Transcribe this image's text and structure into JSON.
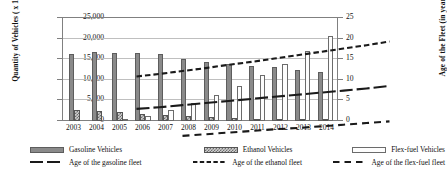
{
  "chart_data": {
    "type": "bar",
    "title": "",
    "subtitle": "",
    "xlabel": "",
    "ylabel": "Quantity of  Vehicles ( x 10^3 )",
    "y2label": "Age of the Fleet (in years)",
    "ylim": [
      0,
      25000
    ],
    "y2lim": [
      0,
      25
    ],
    "grid": true,
    "legend_position": "bottom",
    "categories": [
      "2003",
      "2004",
      "2005",
      "2006",
      "2007",
      "2008",
      "2009",
      "2010",
      "2011",
      "2012",
      "2013",
      "2014"
    ],
    "y_ticks": [
      "0",
      "5,000",
      "10,000",
      "15,000",
      "20,000",
      "25,000"
    ],
    "y2_ticks": [
      "0",
      "5",
      "10",
      "15",
      "20",
      "25"
    ],
    "series": [
      {
        "name": "Gasoline Vehicles",
        "type": "bar",
        "axis": "left",
        "color": "#8a8a8a",
        "values": [
          16000,
          16500,
          16300,
          16400,
          16100,
          15000,
          14200,
          13600,
          13300,
          12900,
          12300,
          11700
        ]
      },
      {
        "name": "Ethanol Vehicles",
        "type": "bar",
        "axis": "left",
        "color": "#cfcfcf",
        "values": [
          2600,
          2400,
          2200,
          1800,
          1400,
          1100,
          900,
          700,
          600,
          500,
          400,
          300
        ]
      },
      {
        "name": "Flex-fuel Vehicles",
        "type": "bar",
        "axis": "left",
        "color": "#fdfdfd",
        "values": [
          0,
          0,
          300,
          1200,
          2600,
          4400,
          6300,
          8300,
          11000,
          13700,
          16900,
          20400
        ]
      },
      {
        "name": "Age of the gasoline fleet",
        "type": "line",
        "axis": "right",
        "color": "#1a1a1a",
        "values": [
          7.0,
          7.4,
          7.9,
          8.4,
          8.9,
          9.4,
          9.9,
          10.4,
          10.9,
          11.4,
          11.9,
          12.5
        ]
      },
      {
        "name": "Age of the ethanol fleet",
        "type": "line",
        "axis": "right",
        "color": "#1a1a1a",
        "values": [
          14.8,
          15.4,
          16.1,
          16.8,
          17.6,
          18.3,
          19.1,
          19.9,
          20.7,
          21.5,
          22.3,
          23.2
        ]
      },
      {
        "name": "Age of the flex-fuel fleet",
        "type": "line",
        "axis": "right",
        "color": "#1a1a1a",
        "values": [
          null,
          null,
          0.5,
          0.9,
          1.3,
          1.7,
          2.1,
          2.4,
          2.8,
          3.2,
          3.6,
          4.0
        ]
      }
    ]
  },
  "legend": {
    "items": [
      {
        "label": "Gasoline Vehicles",
        "marker": "bar-solid-gray"
      },
      {
        "label": "Ethanol Vehicles",
        "marker": "bar-hatched"
      },
      {
        "label": "Flex-fuel Vehicles",
        "marker": "bar-outline-white"
      },
      {
        "label": "Age of the gasoline fleet",
        "marker": "line-long-dash"
      },
      {
        "label": "Age of the ethanol fleet",
        "marker": "line-medium-dash"
      },
      {
        "label": "Age of the flex-fuel  fleet",
        "marker": "line-short-dash"
      }
    ]
  }
}
